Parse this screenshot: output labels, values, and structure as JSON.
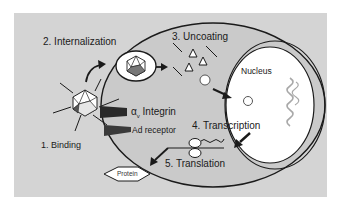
{
  "diagram": {
    "colors": {
      "background": "#d4d4d4",
      "cell_fill": "#c8c8c8",
      "outline": "#1a1a1a",
      "nucleus_fill": "#ffffff",
      "receptor": "#2a2a2a",
      "dna": "#a8a8a8"
    },
    "steps": [
      {
        "id": "binding",
        "label": "1. Binding"
      },
      {
        "id": "internalization",
        "label": "2. Internalization"
      },
      {
        "id": "uncoating",
        "label": "3. Uncoating"
      },
      {
        "id": "transcription",
        "label": "4. Transcription"
      },
      {
        "id": "translation",
        "label": "5. Translation"
      }
    ],
    "labels": {
      "nucleus": "Nucleus",
      "integrin_alpha": "α",
      "integrin_sub": "v",
      "integrin": "Integrin",
      "ad_receptor": "Ad receptor",
      "protein": "Protein"
    }
  }
}
